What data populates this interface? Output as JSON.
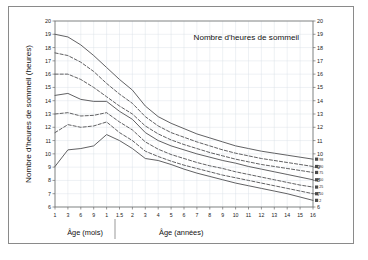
{
  "figure": {
    "title": "Nombre d'heures de sommeil",
    "y_axis_label": "Nombre d'heures de sommeil (heures)",
    "age_label_months": "Âge (mois)",
    "age_label_years": "Âge (années)"
  },
  "chart_data": {
    "type": "line",
    "title": "Nombre d'heures de sommeil",
    "xlabel": "Âge (mois) | Âge (années)",
    "ylabel": "Nombre d'heures de sommeil (heures)",
    "ylim": [
      6,
      20
    ],
    "ytick_labels": [
      "20",
      "19",
      "18",
      "17",
      "16",
      "15",
      "14",
      "13",
      "12",
      "11",
      "10",
      "9",
      "8",
      "7",
      "6"
    ],
    "ytick_values": [
      20,
      19,
      18,
      17,
      16,
      15,
      14,
      13,
      12,
      11,
      10,
      9,
      8,
      7,
      6
    ],
    "grid": true,
    "legend": "right-edge percentile labels",
    "dual_y_axis": true,
    "x_categories": [
      "1",
      "3",
      "6",
      "9",
      "1",
      "1.5",
      "2",
      "3",
      "4",
      "5",
      "6",
      "7",
      "8",
      "9",
      "10",
      "11",
      "12",
      "13",
      "14",
      "15",
      "16"
    ],
    "x_units": [
      "mois",
      "mois",
      "mois",
      "mois",
      "années",
      "années",
      "années",
      "années",
      "années",
      "années",
      "années",
      "années",
      "années",
      "années",
      "années",
      "années",
      "années",
      "années",
      "années",
      "années",
      "années"
    ],
    "x_months_group": [
      "1",
      "3",
      "6",
      "9"
    ],
    "x_years_group": [
      "1",
      "1.5",
      "2",
      "3",
      "4",
      "5",
      "6",
      "7",
      "8",
      "9",
      "10",
      "11",
      "12",
      "13",
      "14",
      "15",
      "16"
    ],
    "series": [
      {
        "name": "98",
        "style": "solid",
        "values": [
          19.0,
          18.8,
          18.2,
          17.4,
          16.5,
          15.6,
          14.8,
          13.6,
          12.8,
          12.3,
          11.9,
          11.5,
          11.2,
          10.9,
          10.6,
          10.4,
          10.2,
          10.05,
          9.9,
          9.75,
          9.6
        ]
      },
      {
        "name": "90",
        "style": "dashed",
        "values": [
          17.6,
          17.4,
          16.9,
          16.2,
          15.3,
          14.5,
          13.8,
          12.8,
          12.1,
          11.6,
          11.25,
          10.9,
          10.6,
          10.3,
          10.05,
          9.85,
          9.65,
          9.5,
          9.35,
          9.2,
          9.05
        ]
      },
      {
        "name": "75",
        "style": "dashed",
        "values": [
          16.0,
          16.0,
          15.6,
          15.0,
          14.3,
          13.6,
          13.0,
          12.1,
          11.5,
          11.05,
          10.7,
          10.4,
          10.1,
          9.85,
          9.6,
          9.4,
          9.2,
          9.05,
          8.9,
          8.75,
          8.6
        ]
      },
      {
        "name": "50",
        "style": "solid",
        "values": [
          14.4,
          14.55,
          14.1,
          13.95,
          13.95,
          13.2,
          12.6,
          11.6,
          11.0,
          10.6,
          10.3,
          10.0,
          9.75,
          9.5,
          9.3,
          9.05,
          8.85,
          8.65,
          8.45,
          8.25,
          8.05
        ]
      },
      {
        "name": "25",
        "style": "dashed",
        "values": [
          13.0,
          13.1,
          12.85,
          12.9,
          13.1,
          12.4,
          11.8,
          10.9,
          10.35,
          9.95,
          9.65,
          9.35,
          9.1,
          8.9,
          8.65,
          8.45,
          8.25,
          8.05,
          7.85,
          7.65,
          7.5
        ]
      },
      {
        "name": "10",
        "style": "dashed",
        "values": [
          11.6,
          12.2,
          12.0,
          12.1,
          12.4,
          11.6,
          11.0,
          10.2,
          9.8,
          9.45,
          9.15,
          8.9,
          8.65,
          8.4,
          8.2,
          8.0,
          7.8,
          7.6,
          7.4,
          7.2,
          7.0
        ]
      },
      {
        "name": "2",
        "style": "solid",
        "values": [
          9.05,
          10.3,
          10.4,
          10.6,
          11.45,
          11.0,
          10.4,
          9.65,
          9.5,
          9.2,
          8.85,
          8.55,
          8.3,
          8.05,
          7.8,
          7.6,
          7.4,
          7.2,
          7.0,
          6.75,
          6.5
        ]
      }
    ]
  }
}
